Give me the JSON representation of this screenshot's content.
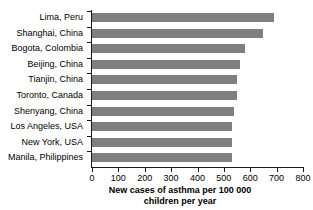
{
  "chart_data": {
    "type": "bar",
    "orientation": "horizontal",
    "title": "",
    "xlabel": "New cases of asthma per 100 000 children per year",
    "ylabel": "",
    "xlim": [
      0,
      800
    ],
    "xticks": [
      0,
      100,
      200,
      300,
      400,
      500,
      600,
      700,
      800
    ],
    "grid": false,
    "legend": false,
    "bar_color": "#7f7f7f",
    "categories": [
      "Lima, Peru",
      "Shanghai, China",
      "Bogota, Colombia",
      "Beijing, China",
      "Tianjin, China",
      "Toronto, Canada",
      "Shenyang, China",
      "Los Angeles, USA",
      "New York, USA",
      "Manila, Philippines"
    ],
    "values": [
      690,
      650,
      580,
      560,
      550,
      550,
      540,
      530,
      530,
      530
    ]
  },
  "axis_title": {
    "line1": "New cases of asthma per 100 000",
    "line2": "children per year"
  }
}
